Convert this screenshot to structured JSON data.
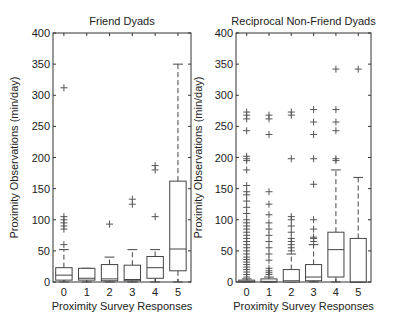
{
  "chart_data": [
    {
      "type": "box",
      "title": "Friend Dyads",
      "xlabel": "Proximity Survey Responses",
      "ylabel": "Proximity Observations (min/day)",
      "ylim": [
        0,
        400
      ],
      "yticks": [
        0,
        50,
        100,
        150,
        200,
        250,
        300,
        350,
        400
      ],
      "categories": [
        "0",
        "1",
        "2",
        "3",
        "4",
        "5"
      ],
      "boxes": [
        {
          "category": "0",
          "whisker_low": 0,
          "q1": 3,
          "median": 11,
          "q3": 23,
          "whisker_high": 52,
          "outliers": [
            60,
            85,
            90,
            95,
            100,
            105,
            312
          ]
        },
        {
          "category": "1",
          "whisker_low": 0,
          "q1": 3,
          "median": 6,
          "q3": 22,
          "whisker_high": 22,
          "outliers": []
        },
        {
          "category": "2",
          "whisker_low": 0,
          "q1": 2,
          "median": 5,
          "q3": 28,
          "whisker_high": 40,
          "outliers": [
            93
          ]
        },
        {
          "category": "3",
          "whisker_low": 0,
          "q1": 2,
          "median": 4,
          "q3": 27,
          "whisker_high": 52,
          "outliers": [
            125,
            133
          ]
        },
        {
          "category": "4",
          "whisker_low": 0,
          "q1": 6,
          "median": 23,
          "q3": 41,
          "whisker_high": 52,
          "outliers": [
            105,
            180,
            187
          ]
        },
        {
          "category": "5",
          "whisker_low": 0,
          "q1": 18,
          "median": 53,
          "q3": 162,
          "whisker_high": 350,
          "outliers": []
        }
      ]
    },
    {
      "type": "box",
      "title": "Reciprocal Non-Friend Dyads",
      "xlabel": "Proximity Survey Responses",
      "ylabel": "Proximity Observations (min/day)",
      "ylim": [
        0,
        400
      ],
      "yticks": [
        0,
        50,
        100,
        150,
        200,
        250,
        300,
        350,
        400
      ],
      "categories": [
        "0",
        "1",
        "2",
        "3",
        "4",
        "5"
      ],
      "boxes": [
        {
          "category": "0",
          "whisker_low": 0,
          "q1": 0,
          "median": 1,
          "q3": 3,
          "whisker_high": 5,
          "outliers": [
            8,
            12,
            16,
            20,
            24,
            28,
            32,
            36,
            40,
            45,
            50,
            55,
            60,
            65,
            70,
            75,
            80,
            85,
            90,
            95,
            100,
            110,
            120,
            130,
            140,
            145,
            155,
            180,
            195,
            198,
            202,
            243,
            262,
            268,
            273
          ]
        },
        {
          "category": "1",
          "whisker_low": 0,
          "q1": 0,
          "median": 1,
          "q3": 5,
          "whisker_high": 8,
          "outliers": [
            12,
            15,
            18,
            22,
            35,
            45,
            55,
            65,
            75,
            85,
            95,
            108,
            125,
            145,
            237,
            262,
            268
          ]
        },
        {
          "category": "2",
          "whisker_low": 0,
          "q1": 0,
          "median": 2,
          "q3": 20,
          "whisker_high": 45,
          "outliers": [
            50,
            55,
            60,
            65,
            70,
            80,
            90,
            100,
            105,
            198,
            268,
            273
          ]
        },
        {
          "category": "3",
          "whisker_low": 0,
          "q1": 2,
          "median": 8,
          "q3": 28,
          "whisker_high": 60,
          "outliers": [
            65,
            70,
            72,
            85,
            100,
            157,
            198,
            237,
            257,
            277
          ]
        },
        {
          "category": "4",
          "whisker_low": 0,
          "q1": 8,
          "median": 52,
          "q3": 80,
          "whisker_high": 180,
          "outliers": [
            195,
            198,
            243,
            257,
            277,
            342
          ]
        },
        {
          "category": "5",
          "whisker_low": 0,
          "q1": 0,
          "median": 0,
          "q3": 70,
          "whisker_high": 168,
          "outliers": [
            342
          ]
        }
      ]
    }
  ]
}
